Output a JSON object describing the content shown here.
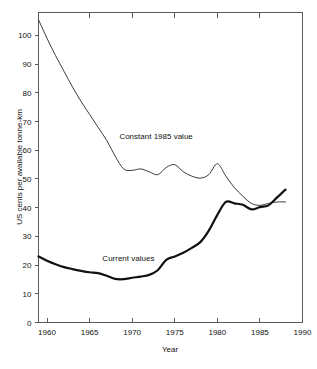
{
  "chart_data": {
    "type": "line",
    "title": "",
    "xlabel": "Year",
    "ylabel": "US cents per available tonne-km",
    "xlim": [
      1959,
      1990
    ],
    "ylim": [
      0,
      108
    ],
    "xticks": [
      1960,
      1965,
      1970,
      1975,
      1980,
      1985,
      1990
    ],
    "xticklabels": [
      "1960",
      "1965",
      "1970",
      "1975",
      "1980",
      "1985",
      "1990"
    ],
    "yticks": [
      0,
      10,
      20,
      30,
      40,
      50,
      60,
      70,
      80,
      90,
      100
    ],
    "yticklabels": [
      "0",
      "10",
      "20",
      "30",
      "40",
      "50",
      "60",
      "70",
      "80",
      "90",
      "100"
    ],
    "grid": false,
    "legend": "inline-annotations",
    "series": [
      {
        "name": "Constant 1985 value",
        "style": "thin",
        "label_x": 1968.5,
        "label_y": 64,
        "x": [
          1959,
          1960,
          1961,
          1962,
          1963,
          1964,
          1965,
          1966,
          1967,
          1968,
          1969,
          1970,
          1971,
          1972,
          1973,
          1974,
          1975,
          1976,
          1977,
          1978,
          1979,
          1980,
          1981,
          1982,
          1983,
          1984,
          1985,
          1986,
          1987,
          1988
        ],
        "y": [
          105.5,
          99.0,
          93.0,
          87.5,
          82.0,
          77.0,
          72.5,
          68.0,
          63.5,
          58.0,
          53.5,
          53.0,
          53.5,
          52.5,
          51.5,
          54.0,
          55.0,
          52.5,
          51.0,
          50.3,
          51.5,
          55.3,
          51.0,
          47.0,
          44.0,
          41.5,
          40.8,
          41.5,
          42.0,
          42.0
        ]
      },
      {
        "name": "Current values",
        "style": "thick",
        "label_x": 1966.5,
        "label_y": 21.5,
        "x": [
          1959,
          1960,
          1961,
          1962,
          1963,
          1964,
          1965,
          1966,
          1967,
          1968,
          1969,
          1970,
          1971,
          1972,
          1973,
          1974,
          1975,
          1976,
          1977,
          1978,
          1979,
          1980,
          1981,
          1982,
          1983,
          1984,
          1985,
          1986,
          1987,
          1988
        ],
        "y": [
          23.0,
          21.5,
          20.3,
          19.3,
          18.6,
          18.0,
          17.5,
          17.2,
          16.3,
          15.2,
          15.1,
          15.6,
          16.0,
          16.6,
          18.2,
          21.8,
          23.0,
          24.3,
          26.0,
          28.0,
          32.0,
          37.5,
          42.0,
          41.5,
          41.0,
          39.4,
          40.2,
          40.8,
          43.5,
          46.3
        ]
      }
    ]
  },
  "axes": {
    "x_axis_title": "Year",
    "y_axis_title": "US cents per available tonne-km"
  }
}
